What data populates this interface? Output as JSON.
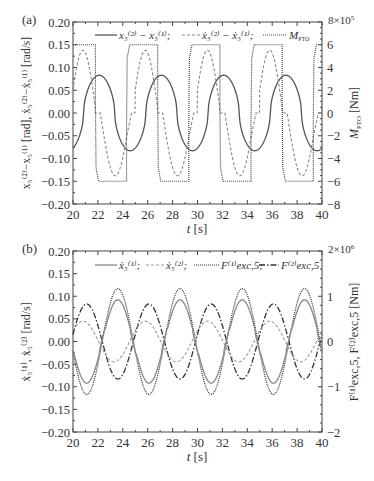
{
  "chart_data": [
    {
      "panel_label": "(a)",
      "type": "line",
      "xlabel": "t [s]",
      "ylabel_left": "x5(2)−x5(1) [rad], ẋ5(2)−ẋ5(1) [rad/s]",
      "ylabel_right": "M_PTO [Nm]",
      "right_axis_multiplier": "8×10^5",
      "xlim": [
        20,
        40
      ],
      "ylim_left": [
        -0.2,
        0.2
      ],
      "ylim_right": [
        -8,
        8
      ],
      "x_ticks": [
        "20",
        "22",
        "24",
        "26",
        "28",
        "30",
        "32",
        "34",
        "36",
        "38",
        "40"
      ],
      "y_ticks_left": [
        "0.20",
        "0.15",
        "0.10",
        "0.05",
        "0.00",
        "−0.05",
        "−0.10",
        "−0.15",
        "−0.20"
      ],
      "y_ticks_right": [
        "8×10⁵",
        "6",
        "4",
        "2",
        "0",
        "−2",
        "−4",
        "−6",
        "−8"
      ],
      "legend": [
        "x5(2) − x5(1);",
        "ẋ5(2) − ẋ5(1);",
        "M_PTO"
      ],
      "legend_position": "top",
      "grid": false,
      "period_s": 5,
      "series": [
        {
          "name": "x5(2) − x5(1)",
          "style": "solid",
          "amplitude": 0.083,
          "peaks_at_s": [
            22.1,
            27.1,
            32.1,
            37.1
          ],
          "troughs_at_s": [
            24.6,
            29.6,
            34.6,
            39.6
          ]
        },
        {
          "name": "ẋ5(2) − ẋ5(1)",
          "style": "dashed",
          "amplitude": 0.138,
          "peaks_at_s": [
            20.9,
            25.9,
            30.9,
            35.9
          ],
          "troughs_at_s": [
            23.5,
            28.5,
            33.5,
            38.5
          ]
        },
        {
          "name": "M_PTO",
          "style": "dotted",
          "axis": "right",
          "levels": [
            6,
            -6
          ],
          "switch_down_s": [
            21.8,
            26.8,
            31.8,
            36.8
          ],
          "switch_up_s": [
            24.3,
            29.3,
            34.3,
            39.3
          ]
        }
      ]
    },
    {
      "panel_label": "(b)",
      "type": "line",
      "xlabel": "t [s]",
      "ylabel_left": "ẋ5(1), ẋ5(2) [rad/s]",
      "ylabel_right": "F_exc,5(1), F_exc,5(2) [Nm]",
      "right_axis_multiplier": "2×10^6",
      "xlim": [
        20,
        40
      ],
      "ylim_left": [
        -0.2,
        0.2
      ],
      "ylim_right": [
        -2,
        2
      ],
      "x_ticks": [
        "20",
        "22",
        "24",
        "26",
        "28",
        "30",
        "32",
        "34",
        "36",
        "38",
        "40"
      ],
      "y_ticks_left": [
        "0.20",
        "0.15",
        "0.10",
        "0.05",
        "0.00",
        "−0.05",
        "−0.10",
        "−0.15",
        "−0.20"
      ],
      "y_ticks_right": [
        "2×10⁶",
        "1",
        "0",
        "−1",
        "−2"
      ],
      "legend": [
        "ẋ5(1);",
        "ẋ5(2);",
        "F_exc,5(1);",
        "F_exc,5(2)"
      ],
      "legend_position": "top",
      "grid": false,
      "period_s": 5,
      "series": [
        {
          "name": "ẋ5(1)",
          "style": "solid-gray",
          "amplitude": 0.092,
          "peaks_at_s": [
            23.6,
            28.6,
            33.6,
            38.6
          ]
        },
        {
          "name": "ẋ5(2)",
          "style": "dashed",
          "amplitude": 0.045,
          "peaks_at_s": [
            20.8,
            25.8,
            30.8,
            35.8
          ]
        },
        {
          "name": "F_exc,5(1)",
          "style": "dotted",
          "axis": "right",
          "amplitude": 1.17,
          "peaks_at_s": [
            23.6,
            28.6,
            33.6,
            38.6
          ]
        },
        {
          "name": "F_exc,5(2)",
          "style": "dash-dot",
          "axis": "right",
          "amplitude": 0.83,
          "peaks_at_s": [
            21.1,
            26.1,
            31.1,
            36.1
          ]
        }
      ]
    }
  ],
  "panels": {
    "a": {
      "label": "(a)",
      "xlabel_t": "t",
      "xlabel_unit": " [s]",
      "right_top": "8×10",
      "right_top_exp": "5",
      "ylabel_right": "[Nm]",
      "ylabel_right_sym": "M",
      "ylabel_right_sub": "PTO",
      "ylabel_left": "x₅⁽²⁾−x₅⁽¹⁾ [rad],  ẋ₅⁽²⁾−ẋ₅⁽¹⁾ [rad/s]",
      "legend": [
        "x₅⁽²⁾ − x₅⁽¹⁾;",
        "ẋ₅⁽²⁾ − ẋ₅⁽¹⁾;",
        "M",
        "PTO"
      ]
    },
    "b": {
      "label": "(b)",
      "xlabel_t": "t",
      "xlabel_unit": " [s]",
      "right_top": "2×10",
      "right_top_exp": "6",
      "ylabel_right": "F⁽¹⁾exc,5, F⁽²⁾exc,5  [Nm]",
      "ylabel_left": "ẋ₅⁽¹⁾, ẋ₅⁽²⁾ [rad/s]",
      "legend": [
        "ẋ₅⁽¹⁾;",
        "ẋ₅⁽²⁾;",
        "F⁽¹⁾exc,5;",
        "F⁽²⁾exc,5"
      ]
    }
  }
}
